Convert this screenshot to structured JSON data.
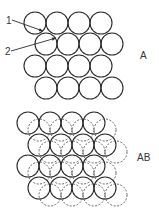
{
  "diagram": {
    "panel_a": {
      "label": "A",
      "callouts": [
        {
          "label": "1",
          "text_pos": [
            6,
            16
          ],
          "from": [
            12,
            20
          ],
          "to": [
            43,
            31
          ]
        },
        {
          "label": "2",
          "text_pos": [
            5,
            47
          ],
          "from": [
            11,
            51
          ],
          "to": [
            56,
            38
          ]
        }
      ],
      "circle_radius": 11,
      "layer_a_centers": [
        [
          35,
          23
        ],
        [
          57,
          23
        ],
        [
          79,
          23
        ],
        [
          101,
          23
        ],
        [
          46,
          44
        ],
        [
          68,
          44
        ],
        [
          90,
          44
        ],
        [
          112,
          44
        ],
        [
          35,
          66
        ],
        [
          57,
          66
        ],
        [
          79,
          66
        ],
        [
          101,
          66
        ],
        [
          46,
          88
        ],
        [
          68,
          88
        ],
        [
          90,
          88
        ],
        [
          112,
          88
        ]
      ]
    },
    "panel_ab": {
      "label": "AB",
      "circle_radius": 11,
      "layer_a_style": "solid",
      "layer_b_style": "dashed",
      "layer_a_centers": [
        [
          28,
          123
        ],
        [
          50,
          123
        ],
        [
          72,
          123
        ],
        [
          94,
          123
        ],
        [
          39,
          145
        ],
        [
          61,
          145
        ],
        [
          83,
          145
        ],
        [
          105,
          145
        ],
        [
          28,
          166
        ],
        [
          50,
          166
        ],
        [
          72,
          166
        ],
        [
          94,
          166
        ],
        [
          39,
          188
        ],
        [
          61,
          188
        ],
        [
          83,
          188
        ],
        [
          105,
          188
        ]
      ],
      "layer_b_offset": [
        11,
        7
      ]
    },
    "colors": {
      "stroke": "#2a2a2a",
      "dashed": "#555555",
      "text": "#333333"
    }
  }
}
